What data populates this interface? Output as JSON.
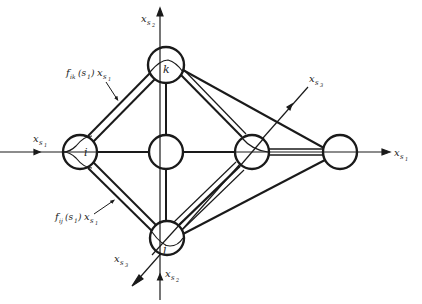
{
  "colors": {
    "stroke": "#1a1a1a",
    "background": "#ffffff"
  },
  "axes": {
    "x_s1": {
      "label": "x",
      "sub": "s",
      "subsub": "1"
    },
    "x_s2": {
      "label": "x",
      "sub": "s",
      "subsub": "2"
    },
    "x_s3": {
      "label": "x",
      "sub": "s",
      "subsub": "3"
    }
  },
  "nodes": {
    "i": {
      "label": "i"
    },
    "k": {
      "label": "k"
    },
    "j": {
      "label": "j"
    },
    "center": {
      "label": ""
    },
    "s3_node": {
      "label": ""
    },
    "far_right": {
      "label": ""
    }
  },
  "annotations": {
    "fik": {
      "f": "f",
      "sub": "ik",
      "arg": "(s",
      "argsub": "1",
      "close": ")",
      "x": "x",
      "xsub": "s",
      "xsubsub": "1"
    },
    "fij": {
      "f": "f",
      "sub": "ij",
      "arg": "(s",
      "argsub": "1",
      "close": ")",
      "x": "x",
      "xsub": "s",
      "xsubsub": "1"
    }
  }
}
